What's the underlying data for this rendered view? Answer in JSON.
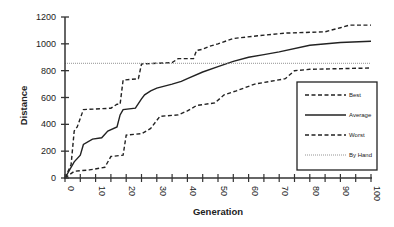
{
  "chart_data": {
    "type": "line",
    "title": "",
    "xlabel": "Generation",
    "ylabel": "Distance",
    "xlim": [
      0,
      100
    ],
    "ylim": [
      0,
      1200
    ],
    "xticks": [
      0,
      10,
      20,
      30,
      40,
      50,
      60,
      70,
      80,
      90,
      100
    ],
    "xminor_step": 5,
    "yticks": [
      0,
      200,
      400,
      600,
      800,
      1000,
      1200
    ],
    "grid": false,
    "legend_position": "right",
    "series": [
      {
        "name": "Best",
        "style": "dashed",
        "color": "#222222",
        "x": [
          0,
          2,
          3,
          4,
          6,
          15,
          17,
          18,
          19,
          24,
          25,
          30,
          35,
          37,
          42,
          43,
          45,
          47,
          50,
          55,
          63,
          72,
          85,
          90,
          93,
          100
        ],
        "y": [
          0,
          100,
          350,
          380,
          510,
          520,
          550,
          550,
          730,
          740,
          850,
          855,
          860,
          890,
          890,
          950,
          960,
          980,
          1000,
          1040,
          1060,
          1080,
          1090,
          1120,
          1140,
          1140
        ]
      },
      {
        "name": "Average",
        "style": "solid",
        "color": "#222222",
        "x": [
          0,
          3,
          5,
          6,
          9,
          12,
          14,
          17,
          18,
          19,
          23,
          25,
          26,
          28,
          30,
          35,
          38,
          40,
          45,
          50,
          55,
          60,
          65,
          70,
          80,
          90,
          100
        ],
        "y": [
          0,
          120,
          170,
          250,
          290,
          300,
          350,
          380,
          470,
          510,
          520,
          590,
          620,
          650,
          670,
          700,
          720,
          740,
          790,
          830,
          870,
          900,
          920,
          940,
          990,
          1010,
          1020
        ]
      },
      {
        "name": "Worst",
        "style": "dashed",
        "color": "#222222",
        "x": [
          0,
          3,
          8,
          13,
          15,
          19,
          20,
          25,
          28,
          31,
          37,
          40,
          43,
          49,
          52,
          56,
          62,
          67,
          72,
          75,
          80,
          100
        ],
        "y": [
          0,
          50,
          60,
          80,
          160,
          170,
          320,
          330,
          370,
          460,
          470,
          500,
          540,
          560,
          620,
          650,
          700,
          720,
          740,
          800,
          810,
          820
        ]
      },
      {
        "name": "By Hand",
        "style": "dotted",
        "color": "#888888",
        "x": [
          0,
          100
        ],
        "y": [
          855,
          855
        ]
      }
    ]
  }
}
